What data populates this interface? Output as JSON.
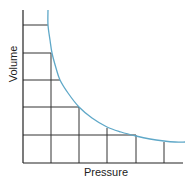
{
  "chart_data": {
    "type": "line",
    "title": "",
    "xlabel": "Pressure",
    "ylabel": "Volume",
    "grid": "step-rectangles under curve",
    "curve_description": "Inverse relationship (Boyle's law): volume decreases hyperbolically as pressure increases",
    "x": [
      1,
      2,
      3,
      4,
      5,
      6
    ],
    "series": [
      {
        "name": "Volume vs Pressure",
        "values": [
          5.5,
          4,
          3,
          2,
          1.25,
          1
        ]
      }
    ],
    "grid_rows": 5,
    "grid_cols": 6,
    "curve_color": "#5fa8c8",
    "grid_color": "#333333"
  },
  "labels": {
    "x_axis": "Pressure",
    "y_axis": "Volume"
  },
  "geometry": {
    "origin": [
      23,
      163
    ],
    "y_axis_top": 10,
    "x_axis_right": 183,
    "h_lines": [
      [
        25,
        48
      ],
      [
        53,
        51
      ],
      [
        80,
        60
      ],
      [
        107,
        79
      ],
      [
        135,
        136
      ]
    ],
    "v_lines": [
      [
        51,
        53
      ],
      [
        79,
        107
      ],
      [
        107,
        128
      ],
      [
        136,
        135
      ],
      [
        164,
        142
      ]
    ],
    "curve_points": [
      [
        48,
        10
      ],
      [
        48,
        25
      ],
      [
        50,
        40
      ],
      [
        52,
        53
      ],
      [
        56,
        68
      ],
      [
        60,
        80
      ],
      [
        68,
        93
      ],
      [
        79,
        107
      ],
      [
        92,
        118
      ],
      [
        107,
        127
      ],
      [
        121,
        132
      ],
      [
        136,
        136
      ],
      [
        150,
        139
      ],
      [
        164,
        141
      ],
      [
        175,
        142
      ],
      [
        185,
        142
      ]
    ]
  }
}
